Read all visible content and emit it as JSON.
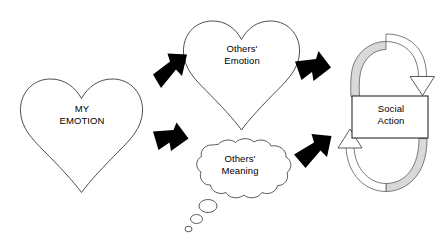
{
  "diagram": {
    "background_color": "#ffffff",
    "outline_color": "#3a3a3a",
    "arrow_color": "#000000",
    "loop_shade_color": "#d9d9d9",
    "nodes": [
      {
        "id": "my-emotion",
        "label": "MY\nEMOTION",
        "shape": "heart"
      },
      {
        "id": "others-emotion",
        "label": "Others'\nEmotion",
        "shape": "heart"
      },
      {
        "id": "others-meaning",
        "label": "Others'\nMeaning",
        "shape": "thought-cloud"
      },
      {
        "id": "social-action",
        "label": "Social\nAction",
        "shape": "rectangle"
      }
    ],
    "connectors": [
      {
        "id": "arrow-emotion-to-others-emotion",
        "from": "my-emotion",
        "to": "others-emotion",
        "style": "solid-block-arrow",
        "direction": "up-right"
      },
      {
        "id": "arrow-emotion-to-others-meaning",
        "from": "my-emotion",
        "to": "others-meaning",
        "style": "solid-block-arrow",
        "direction": "down-right"
      },
      {
        "id": "arrow-others-emotion-to-social-action",
        "from": "others-emotion",
        "to": "social-action",
        "style": "solid-block-arrow",
        "direction": "down-right"
      },
      {
        "id": "arrow-others-meaning-to-social-action",
        "from": "others-meaning",
        "to": "social-action",
        "style": "solid-block-arrow",
        "direction": "up-right"
      },
      {
        "id": "cycle-loop",
        "from": "social-action",
        "to": "social-action",
        "style": "cyclic-loop-arrow",
        "direction": "clockwise"
      }
    ]
  }
}
